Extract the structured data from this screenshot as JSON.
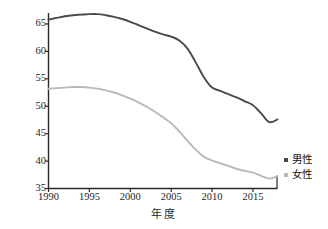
{
  "chart_data": {
    "type": "line",
    "title": "",
    "xlabel": "年  度",
    "ylabel": "年龄标准化发病率(/10万)",
    "xlim": [
      1990,
      2018
    ],
    "ylim": [
      35,
      67
    ],
    "grid": false,
    "legend_position": "right",
    "xticks": [
      1990,
      1995,
      2000,
      2005,
      2010,
      2015
    ],
    "yticks": [
      35,
      40,
      45,
      50,
      55,
      60,
      65
    ],
    "xtick_labels": [
      "1990",
      "1995",
      "2000",
      "2005",
      "2010",
      "2015"
    ],
    "ytick_labels": [
      "35",
      "40",
      "45",
      "50",
      "55",
      "60",
      "65"
    ],
    "x": [
      1990,
      1991,
      1992,
      1993,
      1994,
      1995,
      1996,
      1997,
      1998,
      1999,
      2000,
      2001,
      2002,
      2003,
      2004,
      2005,
      2006,
      2007,
      2008,
      2009,
      2010,
      2011,
      2012,
      2013,
      2014,
      2015,
      2016,
      2017,
      2018
    ],
    "series": [
      {
        "name": "男性",
        "color": "#4a4a4a",
        "values": [
          65.8,
          66.1,
          66.4,
          66.6,
          66.7,
          66.8,
          66.8,
          66.6,
          66.3,
          65.9,
          65.4,
          64.8,
          64.2,
          63.6,
          63.1,
          62.7,
          62.0,
          60.5,
          58.0,
          55.3,
          53.4,
          52.8,
          52.2,
          51.6,
          50.9,
          50.2,
          48.7,
          47.1,
          47.6
        ]
      },
      {
        "name": "女性",
        "color": "#b9b9b9",
        "values": [
          53.2,
          53.3,
          53.4,
          53.5,
          53.5,
          53.4,
          53.2,
          52.9,
          52.5,
          52.0,
          51.4,
          50.7,
          49.9,
          49.0,
          48.0,
          46.9,
          45.4,
          43.7,
          42.1,
          40.8,
          40.1,
          39.6,
          39.1,
          38.6,
          38.2,
          37.9,
          37.3,
          36.8,
          37.3
        ]
      }
    ]
  },
  "legend": {
    "items": [
      {
        "label": "男性",
        "color": "#4a4a4a"
      },
      {
        "label": "女性",
        "color": "#b9b9b9"
      }
    ]
  },
  "axes": {
    "x_title": "年  度",
    "y_title": "年龄标准化发病率(/10万)"
  }
}
